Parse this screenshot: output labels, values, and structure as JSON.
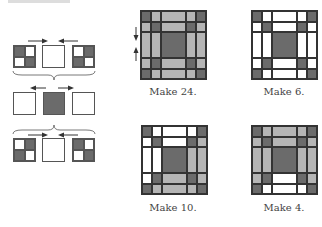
{
  "colors": {
    "dark": "#6b6b6b",
    "light": "#b5b5b5",
    "white": "#ffffff",
    "line": "#555555"
  },
  "assembly_diagram": {
    "rows": [
      {
        "pieces": [
          "four-patch: dark,white/white,dark",
          "white square",
          "four-patch: white,dark/dark,white"
        ],
        "arrows": [
          "right",
          "left"
        ]
      },
      {
        "pieces": [
          "white square",
          "dark square",
          "white square"
        ],
        "arrows": [
          "left",
          "right"
        ]
      },
      {
        "pieces": [
          "four-patch: white,dark/dark,white",
          "white square",
          "four-patch: dark,white/white,dark"
        ],
        "arrows": [
          "right",
          "left"
        ]
      }
    ],
    "braces": 2
  },
  "blocks": [
    {
      "label": "Make 24.",
      "grid": [
        [
          "d",
          "l",
          "l",
          "l",
          "d"
        ],
        [
          "l",
          "d",
          "l",
          "d",
          "l"
        ],
        [
          "l",
          "l",
          "d",
          "l",
          "l"
        ],
        [
          "l",
          "d",
          "l",
          "d",
          "l"
        ],
        [
          "d",
          "l",
          "l",
          "l",
          "d"
        ]
      ],
      "pressing_arrows": [
        "down",
        "up"
      ]
    },
    {
      "label": "Make 6.",
      "grid": [
        [
          "d",
          "w",
          "w",
          "w",
          "d"
        ],
        [
          "w",
          "d",
          "w",
          "d",
          "w"
        ],
        [
          "w",
          "w",
          "d",
          "w",
          "w"
        ],
        [
          "w",
          "d",
          "w",
          "d",
          "w"
        ],
        [
          "d",
          "w",
          "w",
          "w",
          "d"
        ]
      ]
    },
    {
      "label": "Make 10.",
      "grid": [
        [
          "d",
          "w",
          "w",
          "w",
          "d"
        ],
        [
          "w",
          "d",
          "w",
          "d",
          "l"
        ],
        [
          "w",
          "w",
          "d",
          "l",
          "l"
        ],
        [
          "w",
          "d",
          "l",
          "d",
          "l"
        ],
        [
          "d",
          "l",
          "l",
          "l",
          "d"
        ]
      ]
    },
    {
      "label": "Make 4.",
      "grid": [
        [
          "d",
          "l",
          "l",
          "l",
          "d"
        ],
        [
          "l",
          "d",
          "l",
          "d",
          "l"
        ],
        [
          "l",
          "l",
          "d",
          "l",
          "l"
        ],
        [
          "l",
          "d",
          "w",
          "d",
          "l"
        ],
        [
          "d",
          "w",
          "w",
          "w",
          "d"
        ]
      ]
    }
  ]
}
